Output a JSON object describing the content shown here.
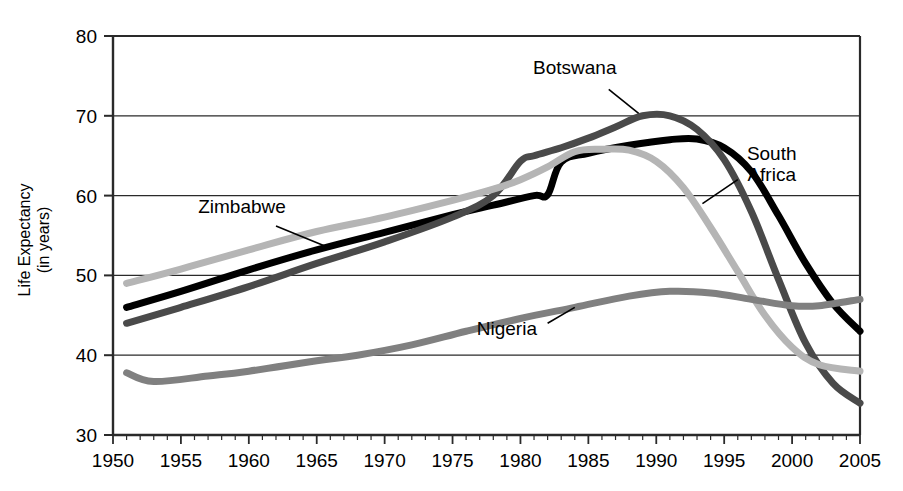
{
  "chart_data": {
    "type": "line",
    "title": "",
    "subtitle": "",
    "xlabel": "",
    "ylabel": "Life Expectancy",
    "ylabel_line2": "(in years)",
    "xlim": [
      1950,
      2005
    ],
    "ylim": [
      30,
      80
    ],
    "ytick_step": 10,
    "xtick_step": 5,
    "x_minor_tick_step": 1,
    "grid": "horizontal",
    "legend": "inline-annotations",
    "x_ticks": [
      "1950",
      "1955",
      "1960",
      "1965",
      "1970",
      "1975",
      "1980",
      "1985",
      "1990",
      "1995",
      "2000",
      "2005"
    ],
    "y_ticks": [
      "30",
      "40",
      "50",
      "60",
      "70",
      "80"
    ],
    "series": [
      {
        "name": "South Africa",
        "color": "#000000",
        "width": 7,
        "label_x": 1998.5,
        "label_y": 64.5,
        "leader_from": [
          1996.0,
          62.0
        ],
        "leader_to": [
          1993.4,
          59.0
        ],
        "points": [
          [
            1951,
            46.0
          ],
          [
            1955,
            48.0
          ],
          [
            1960,
            50.7
          ],
          [
            1965,
            53.2
          ],
          [
            1970,
            55.4
          ],
          [
            1975,
            57.6
          ],
          [
            1978,
            58.8
          ],
          [
            1981,
            60.0
          ],
          [
            1982,
            60.1
          ],
          [
            1983,
            64.2
          ],
          [
            1985,
            65.3
          ],
          [
            1988,
            66.3
          ],
          [
            1991,
            67.0
          ],
          [
            1993,
            67.1
          ],
          [
            1995,
            66.0
          ],
          [
            1997,
            63.0
          ],
          [
            1999,
            57.5
          ],
          [
            2001,
            51.5
          ],
          [
            2003,
            46.5
          ],
          [
            2005,
            43.0
          ]
        ]
      },
      {
        "name": "Botswana",
        "color": "#4a4a4a",
        "width": 7,
        "label_x": 1984.0,
        "label_y": 75.2,
        "leader_from": [
          1986.5,
          73.3
        ],
        "leader_to": [
          1988.7,
          70.3
        ],
        "points": [
          [
            1951,
            44.0
          ],
          [
            1955,
            46.0
          ],
          [
            1960,
            48.6
          ],
          [
            1965,
            51.5
          ],
          [
            1970,
            54.2
          ],
          [
            1975,
            57.3
          ],
          [
            1978,
            60.0
          ],
          [
            1980,
            64.3
          ],
          [
            1981,
            65.0
          ],
          [
            1983,
            66.0
          ],
          [
            1985,
            67.2
          ],
          [
            1987,
            68.6
          ],
          [
            1989,
            70.0
          ],
          [
            1991,
            70.0
          ],
          [
            1993,
            68.3
          ],
          [
            1995,
            64.5
          ],
          [
            1997,
            58.0
          ],
          [
            1999,
            49.5
          ],
          [
            2001,
            41.5
          ],
          [
            2003,
            36.5
          ],
          [
            2005,
            34.0
          ]
        ]
      },
      {
        "name": "Zimbabwe",
        "color": "#b5b5b5",
        "width": 7,
        "label_x": 1959.5,
        "label_y": 57.8,
        "leader_from": [
          1962.0,
          56.2
        ],
        "leader_to": [
          1966.0,
          53.4
        ],
        "points": [
          [
            1951,
            49.0
          ],
          [
            1955,
            50.8
          ],
          [
            1960,
            53.2
          ],
          [
            1965,
            55.5
          ],
          [
            1970,
            57.3
          ],
          [
            1975,
            59.4
          ],
          [
            1978,
            60.8
          ],
          [
            1980,
            62.0
          ],
          [
            1982,
            63.6
          ],
          [
            1984,
            65.5
          ],
          [
            1986,
            65.8
          ],
          [
            1988,
            65.7
          ],
          [
            1990,
            64.3
          ],
          [
            1992,
            61.0
          ],
          [
            1994,
            56.0
          ],
          [
            1996,
            50.5
          ],
          [
            1998,
            45.0
          ],
          [
            2000,
            41.0
          ],
          [
            2002,
            38.8
          ],
          [
            2005,
            38.0
          ]
        ]
      },
      {
        "name": "Nigeria",
        "color": "#808080",
        "width": 7,
        "label_x": 1979.0,
        "label_y": 42.5,
        "leader_from": [
          1982.0,
          44.0
        ],
        "leader_to": [
          1984.0,
          46.0
        ],
        "points": [
          [
            1951,
            37.8
          ],
          [
            1953,
            36.7
          ],
          [
            1957,
            37.4
          ],
          [
            1960,
            38.0
          ],
          [
            1965,
            39.3
          ],
          [
            1968,
            40.0
          ],
          [
            1972,
            41.3
          ],
          [
            1976,
            43.0
          ],
          [
            1980,
            44.6
          ],
          [
            1984,
            46.0
          ],
          [
            1988,
            47.4
          ],
          [
            1991,
            48.0
          ],
          [
            1994,
            47.8
          ],
          [
            1997,
            47.0
          ],
          [
            2000,
            46.2
          ],
          [
            2002,
            46.2
          ],
          [
            2005,
            47.0
          ]
        ]
      }
    ]
  },
  "axis": {
    "y_title_line1": "Life Expectancy",
    "y_title_line2": "(in years)"
  }
}
